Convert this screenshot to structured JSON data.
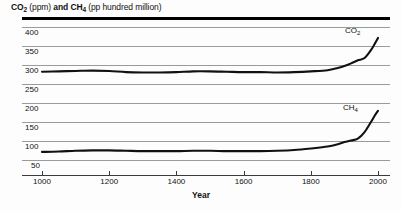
{
  "title": {
    "part1_bold": "CO",
    "part1_sub": "2",
    "part2": " (ppm) ",
    "part3_bold": "and CH",
    "part3_sub": "4",
    "part4": " (pp hundred million)"
  },
  "axis": {
    "x_title": "Year",
    "x_ticks": [
      "1000",
      "1200",
      "1400",
      "1600",
      "1800",
      "2000"
    ],
    "y_ticks": [
      "400",
      "350",
      "300",
      "250",
      "200",
      "150",
      "100",
      "50"
    ]
  },
  "series_labels": {
    "co2_main": "CO",
    "co2_sub": "2",
    "ch4_main": "CH",
    "ch4_sub": "4"
  },
  "colors": {
    "line": "#111111",
    "grid": "#9a9a9a",
    "axis": "#3a3a3a",
    "background": "#fdfdfd"
  },
  "chart_data": {
    "type": "line",
    "title": "CO2 (ppm) and CH4 (pp hundred million)",
    "xlabel": "Year",
    "ylabel": "",
    "xlim": [
      950,
      2010
    ],
    "ylim": [
      25,
      400
    ],
    "grid": true,
    "legend_position": "inline-annotation",
    "yticks": [
      50,
      100,
      150,
      200,
      250,
      300,
      350,
      400
    ],
    "xticks": [
      1000,
      1200,
      1400,
      1600,
      1800,
      2000
    ],
    "series": [
      {
        "name": "CO2",
        "unit": "ppm",
        "x": [
          1000,
          1050,
          1100,
          1150,
          1200,
          1250,
          1300,
          1350,
          1400,
          1450,
          1500,
          1550,
          1600,
          1650,
          1700,
          1750,
          1800,
          1850,
          1880,
          1900,
          1920,
          1940,
          1960,
          1980,
          1990,
          2000
        ],
        "values": [
          281,
          282,
          283,
          284,
          283,
          280,
          279,
          279,
          280,
          282,
          282,
          281,
          280,
          280,
          279,
          280,
          282,
          285,
          291,
          296,
          303,
          311,
          317,
          339,
          354,
          370
        ]
      },
      {
        "name": "CH4",
        "unit": "pp hundred million",
        "x": [
          1000,
          1050,
          1100,
          1150,
          1200,
          1250,
          1300,
          1350,
          1400,
          1450,
          1500,
          1550,
          1600,
          1650,
          1700,
          1750,
          1800,
          1850,
          1880,
          1900,
          1920,
          1940,
          1960,
          1980,
          1990,
          2000
        ],
        "values": [
          70,
          71,
          73,
          74,
          74,
          73,
          72,
          72,
          72,
          73,
          73,
          72,
          72,
          72,
          73,
          75,
          79,
          84,
          90,
          96,
          100,
          105,
          122,
          150,
          165,
          178
        ]
      }
    ]
  }
}
